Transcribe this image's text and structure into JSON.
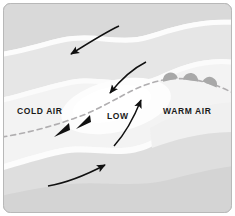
{
  "diagram": {
    "type": "weather-front-schematic",
    "labels": {
      "cold_air": "COLD AIR",
      "low": "LOW",
      "warm_air": "WARM AIR"
    },
    "colors": {
      "background": "#ffffff",
      "border": "#b8b8b8",
      "band_light": "#f2f2f2",
      "band_mid": "#e4e4e4",
      "band_dark": "#d7d7d7",
      "band_darker": "#cfcfcf",
      "white_streak": "#fbfbfb",
      "front_line": "#b0aeb0",
      "cold_barb": "#111111",
      "warm_barb": "#9e9e9e",
      "arrow": "#111111",
      "label_text": "#1a1a1a"
    },
    "front": {
      "line_style": "dashed",
      "dash_pattern": "5 4",
      "cold_front_symbols": 2,
      "cold_front_symbol_shape": "triangle",
      "warm_front_symbols": 3,
      "warm_front_symbol_shape": "semicircle"
    },
    "wind_arrows": [
      {
        "id": "arrow-north-cold-advection",
        "direction": "southwest",
        "region": "top"
      },
      {
        "id": "arrow-center-inflow",
        "direction": "southwest",
        "region": "center"
      },
      {
        "id": "arrow-warm-inflow",
        "direction": "north",
        "region": "right-center"
      },
      {
        "id": "arrow-south-warm-advection",
        "direction": "northeast",
        "region": "bottom"
      }
    ],
    "air_bands": 5
  }
}
